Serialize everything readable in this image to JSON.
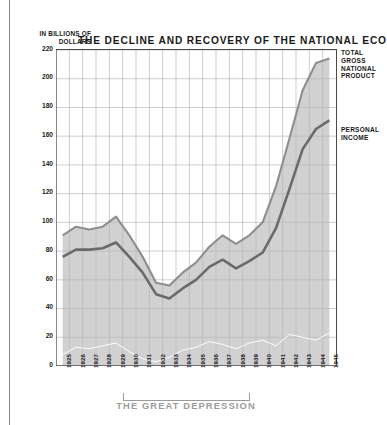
{
  "chart_data": {
    "type": "area",
    "title": "THE DECLINE AND RECOVERY OF THE NATIONAL ECONOMY",
    "ylabel": "IN BILLIONS OF DOLLARS",
    "xlabel": "",
    "ylim": [
      0,
      220
    ],
    "ytick_values": [
      0,
      20,
      40,
      60,
      80,
      100,
      120,
      140,
      160,
      180,
      200,
      220
    ],
    "ytick_labels": [
      "0",
      "20",
      "40",
      "60",
      "80",
      "100",
      "120",
      "140",
      "160",
      "180",
      "200",
      "220"
    ],
    "grid": true,
    "legend_position": "right-inline",
    "categories": [
      "1925",
      "1926",
      "1927",
      "1928",
      "1929",
      "1930",
      "1931",
      "1932",
      "1933",
      "1934",
      "1935",
      "1936",
      "1937",
      "1938",
      "1939",
      "1940",
      "1941",
      "1942",
      "1943",
      "1944",
      "1945"
    ],
    "series": [
      {
        "name": "TOTAL GROSS NATIONAL PRODUCT",
        "values": [
          91,
          97,
          95,
          97,
          104,
          91,
          76,
          58,
          56,
          65,
          72,
          83,
          91,
          85,
          91,
          100,
          125,
          158,
          192,
          211,
          214
        ]
      },
      {
        "name": "PERSONAL INCOME",
        "values": [
          76,
          81,
          81,
          82,
          86,
          76,
          65,
          50,
          47,
          54,
          60,
          69,
          74,
          68,
          73,
          79,
          96,
          123,
          151,
          165,
          171
        ]
      },
      {
        "name": "lower-band-series",
        "values": [
          8,
          13,
          12,
          14,
          16,
          10,
          5,
          3,
          6,
          11,
          13,
          17,
          15,
          12,
          16,
          18,
          14,
          22,
          20,
          18,
          23
        ]
      }
    ],
    "annotations": [
      {
        "text": "TOTAL GROSS NATIONAL PRODUCT",
        "series": "gnp"
      },
      {
        "text": "PERSONAL INCOME",
        "series": "personal_income"
      },
      {
        "text": "THE GREAT DEPRESSION",
        "span": [
          "1929",
          "1939"
        ]
      }
    ]
  },
  "colors": {
    "band_fill": "#b5b5b5",
    "band_edge": "#8e8e8e",
    "income_line": "#6a6a6a",
    "grid": "#b9b9b9",
    "axis": "#4a4a4a",
    "text": "#1a1a1a",
    "caption_gray": "#9b9b9b"
  }
}
